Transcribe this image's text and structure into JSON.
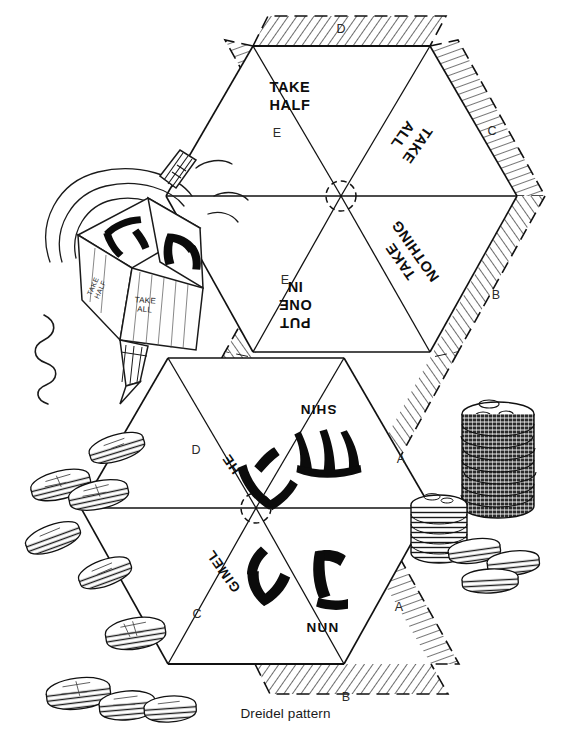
{
  "figure": {
    "caption": "Dreidel pattern",
    "title": "Dreidel pattern"
  },
  "pattern": {
    "faces": [
      {
        "id": "take-half",
        "label": "TAKE\nHALF",
        "rotation": 0,
        "x": 290,
        "y": 78,
        "align": "center"
      },
      {
        "id": "take-all",
        "label": "TAKE\nALL",
        "rotation": 125,
        "x": 410,
        "y": 122,
        "align": "center"
      },
      {
        "id": "put-one-in",
        "label": "PUT\nONE\nIN",
        "rotation": 180,
        "x": 295,
        "y": 282,
        "align": "center"
      },
      {
        "id": "take-nothing",
        "label": "TAKE\nNOTHING",
        "rotation": 235,
        "x": 408,
        "y": 247,
        "align": "center"
      }
    ],
    "hebrew_faces": [
      {
        "id": "shin",
        "label": "SHIN",
        "rotation": 180,
        "x": 318,
        "y": 398,
        "glyph": "shin-glyph"
      },
      {
        "id": "he",
        "label": "HE",
        "rotation": 235,
        "x": 232,
        "y": 452,
        "glyph": "he-glyph"
      },
      {
        "id": "gimel",
        "label": "GIMEL",
        "rotation": 235,
        "x": 224,
        "y": 560,
        "glyph": "gimel-glyph"
      },
      {
        "id": "nun",
        "label": "NUN",
        "rotation": 0,
        "x": 321,
        "y": 623,
        "glyph": "nun-glyph"
      }
    ],
    "tabs": [
      {
        "id": "tab-d-top",
        "label": "D",
        "x": 340,
        "y": 21,
        "rotation": 0
      },
      {
        "id": "tab-e-upper",
        "label": "E",
        "x": 276,
        "y": 126,
        "rotation": 0
      },
      {
        "id": "tab-c-upper",
        "label": "C",
        "x": 491,
        "y": 124,
        "rotation": 0
      },
      {
        "id": "tab-e-mid",
        "label": "E",
        "x": 284,
        "y": 274,
        "rotation": 0
      },
      {
        "id": "tab-b-mid",
        "label": "B",
        "x": 495,
        "y": 288,
        "rotation": 0
      },
      {
        "id": "tab-d-lower",
        "label": "D",
        "x": 195,
        "y": 443,
        "rotation": 0
      },
      {
        "id": "tab-a-upper",
        "label": "A",
        "x": 400,
        "y": 453,
        "rotation": 0
      },
      {
        "id": "tab-c-lower",
        "label": "C",
        "x": 196,
        "y": 607,
        "rotation": 0
      },
      {
        "id": "tab-a-lower",
        "label": "A",
        "x": 398,
        "y": 601,
        "rotation": 0
      },
      {
        "id": "tab-b-bottom",
        "label": "B",
        "x": 345,
        "y": 690,
        "rotation": 0
      }
    ]
  },
  "illustration": {
    "dreidel": {
      "name": "spinning-dreidel",
      "face_text": "TAKE\nALL",
      "side_text": "TAKE\nHALF"
    },
    "coins": {
      "name": "hanukkah-gelt-coins",
      "scattered_count": 9,
      "stack_tall_count": 1,
      "stack_short_count": 1,
      "loose_count": 3
    }
  },
  "colors": {
    "ink": "#111111",
    "paper": "#ffffff",
    "hatch": "#3b3b3b",
    "tab_fill": "#f7f7f7"
  }
}
